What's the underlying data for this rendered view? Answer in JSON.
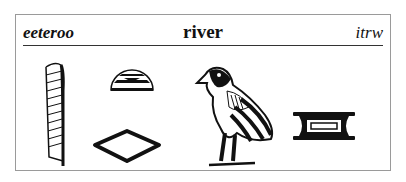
{
  "entry": {
    "pronunciation": "eeteroo",
    "meaning": "river",
    "transliteration": "itrw"
  },
  "glyphs": [
    {
      "name": "reed-leaf-glyph",
      "sign": "reed"
    },
    {
      "name": "placenta-glyph",
      "sign": "semicircle"
    },
    {
      "name": "mouth-glyph",
      "sign": "mouth"
    },
    {
      "name": "quail-chick-glyph",
      "sign": "quail chick"
    },
    {
      "name": "canal-glyph",
      "sign": "canal"
    }
  ]
}
